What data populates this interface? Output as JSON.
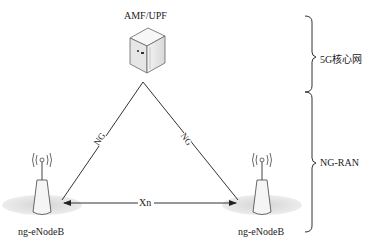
{
  "core": {
    "label": "AMF/UPF",
    "icon": "server-icon"
  },
  "links": {
    "ng_left": "NG",
    "ng_right": "NG",
    "xn": "Xn"
  },
  "nodes": [
    {
      "label": "ng-eNodeB",
      "icon": "base-station-icon"
    },
    {
      "label": "ng-eNodeB",
      "icon": "base-station-icon"
    }
  ],
  "brackets": {
    "core_network": "5G核心网",
    "ran": "NG-RAN"
  },
  "colors": {
    "line": "#333333",
    "ellipse": "#d9d9d9"
  }
}
